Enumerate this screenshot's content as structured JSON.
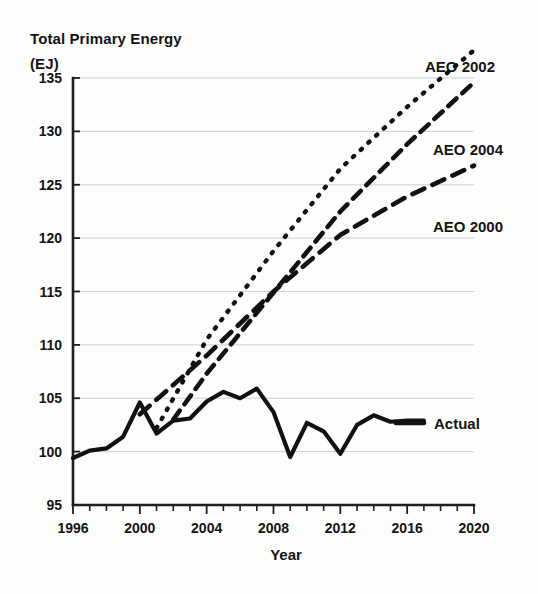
{
  "chart_data": {
    "type": "line",
    "title": "Total Primary Energy (EJ)",
    "title_line1": "Total Primary Energy",
    "title_line2": "(EJ)",
    "xlabel": "Year",
    "ylabel": "Total Primary Energy (EJ)",
    "xlim": [
      1996,
      2020
    ],
    "ylim": [
      95,
      135
    ],
    "yticks": [
      95,
      100,
      105,
      110,
      115,
      120,
      125,
      130,
      135
    ],
    "xticks": [
      1996,
      2000,
      2004,
      2008,
      2012,
      2016,
      2020
    ],
    "xtick_minor_step": 1,
    "grid": "horizontal",
    "legend_position": "inline-right",
    "axis_color": "#1f1f1f",
    "grid_color": "#c9c9c9",
    "line_color": "#111111",
    "background_color": "#fdfdfc",
    "series": [
      {
        "name": "Actual",
        "label": "Actual",
        "style": "solid",
        "x": [
          1996,
          1997,
          1998,
          1999,
          2000,
          2001,
          2002,
          2003,
          2004,
          2005,
          2006,
          2007,
          2008,
          2009,
          2010,
          2011,
          2012,
          2013,
          2014,
          2015,
          2016,
          2017
        ],
        "values": [
          99.4,
          100.1,
          100.3,
          101.4,
          104.6,
          101.7,
          102.9,
          103.1,
          104.7,
          105.6,
          105.0,
          105.9,
          103.7,
          99.5,
          102.7,
          101.9,
          99.8,
          102.5,
          103.4,
          102.8,
          102.9,
          102.9
        ]
      },
      {
        "name": "AEO 2000",
        "label": "AEO 2000",
        "style": "dashed",
        "x": [
          2000,
          2004,
          2008,
          2012,
          2016,
          2020
        ],
        "values": [
          103.5,
          109.0,
          115.0,
          120.3,
          123.9,
          126.8
        ]
      },
      {
        "name": "AEO 2002",
        "label": "AEO 2002",
        "style": "dotted",
        "x": [
          2001,
          2004,
          2008,
          2012,
          2016,
          2020
        ],
        "values": [
          102.2,
          110.5,
          118.8,
          126.5,
          132.3,
          137.6
        ]
      },
      {
        "name": "AEO 2004",
        "label": "AEO 2004",
        "style": "dashed",
        "x": [
          2002,
          2004,
          2008,
          2012,
          2016,
          2020
        ],
        "values": [
          103.0,
          107.3,
          114.9,
          122.5,
          128.8,
          134.6
        ]
      }
    ],
    "annotations": [
      {
        "text": "AEO 2002",
        "x": 2018.0,
        "y": 138.8
      },
      {
        "text": "AEO 2004",
        "x": 2018.4,
        "y": 130.6
      },
      {
        "text": "AEO 2000",
        "x": 2018.4,
        "y": 123.0
      },
      {
        "text": "Actual",
        "x": 2017.5,
        "y": 102.9
      }
    ]
  },
  "ytick_labels": [
    "135",
    "130",
    "125",
    "120",
    "115",
    "110",
    "105",
    "100",
    "95"
  ],
  "xtick_labels": [
    "1996",
    "2000",
    "2004",
    "2008",
    "2012",
    "2016",
    "2020"
  ],
  "labels": {
    "aeo2002": "AEO 2002",
    "aeo2004": "AEO 2004",
    "aeo2000": "AEO 2000",
    "actual": "Actual"
  }
}
